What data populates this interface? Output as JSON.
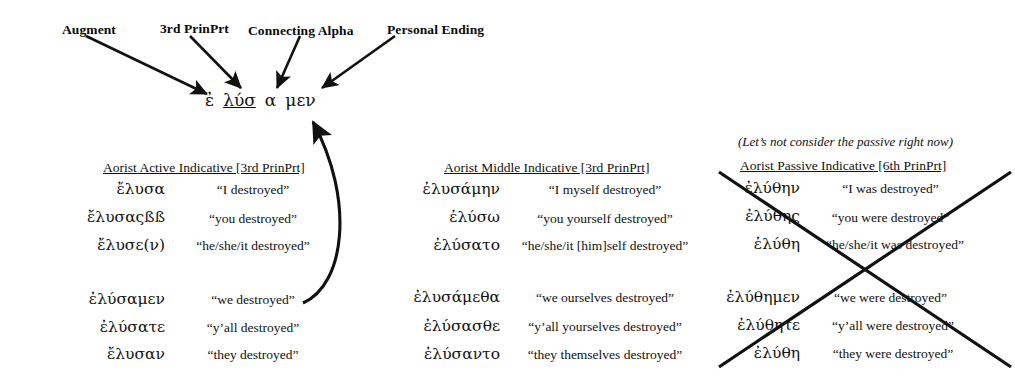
{
  "diagram": {
    "labels": [
      {
        "text": "Augment",
        "x": 62,
        "y": 22
      },
      {
        "text": "3rd PrinPrt",
        "x": 160,
        "y": 21
      },
      {
        "text": "Connecting Alpha",
        "x": 248,
        "y": 23
      },
      {
        "text": "Personal Ending",
        "x": 387,
        "y": 22
      }
    ],
    "parsed_word": {
      "x": 205,
      "y": 90,
      "segments": [
        {
          "text": "ἐ",
          "underline": false,
          "name": "augment"
        },
        {
          "text": "λύσ",
          "underline": true,
          "name": "third-principal-part"
        },
        {
          "text": "α",
          "underline": false,
          "name": "connecting-alpha"
        },
        {
          "text": "μεν",
          "underline": false,
          "name": "personal-ending"
        }
      ]
    }
  },
  "columns": [
    {
      "id": "active",
      "header": "Aorist Active Indicative [3rd PrinPrt]",
      "header_x": 103,
      "header_y": 160,
      "greek_right": 165,
      "gloss_center": 253,
      "rows": [
        {
          "greek": "ἔλυσα",
          "gloss": "“I destroyed”",
          "y": 180
        },
        {
          "greek": "ἔλυσαςßß",
          "gloss": "“you destroyed”",
          "y": 211
        },
        {
          "greek": "ἔλυσε(ν)",
          "gloss": "“he/she/it destroyed”",
          "y": 238
        },
        {
          "greek": "ἐλύσαμεν",
          "gloss": "“we destroyed”",
          "y": 292
        },
        {
          "greek": "ἐλύσατε",
          "gloss": "“y’all destroyed”",
          "y": 320
        },
        {
          "greek": "ἔλυσαν",
          "gloss": "“they destroyed”",
          "y": 347
        }
      ]
    },
    {
      "id": "middle",
      "header": "Aorist Middle Indicative [3rd PrinPrt]",
      "header_x": 444,
      "header_y": 160,
      "greek_right": 500,
      "gloss_center": 605,
      "rows": [
        {
          "greek": "ἐλυσάμην",
          "gloss": "“I myself destroyed”",
          "y": 182
        },
        {
          "greek": "ἐλύσω",
          "gloss": "“you yourself destroyed”",
          "y": 211
        },
        {
          "greek": "ἐλύσατο",
          "gloss": "“he/she/it [him]self destroyed”",
          "y": 238
        },
        {
          "greek": "ἐλυσάμεθα",
          "gloss": "“we ourselves destroyed”",
          "y": 290
        },
        {
          "greek": "ἐλύσασθε",
          "gloss": "“y’all yourselves destroyed”",
          "y": 319
        },
        {
          "greek": "ἐλύσαντο",
          "gloss": "“they themselves destroyed”",
          "y": 347
        }
      ]
    },
    {
      "id": "passive",
      "header": "Aorist Passive Indicative [6th PrinPrt]",
      "header_x": 740,
      "header_y": 158,
      "greek_right": 800,
      "gloss_center": 890,
      "rows": [
        {
          "greek": "ἐλύθην",
          "gloss": "“I was destroyed”",
          "y": 181
        },
        {
          "greek": "ἐλύθης",
          "gloss": "“you were destroyed”",
          "y": 210
        },
        {
          "greek": "ἐλύθη",
          "gloss": "“he/she/it was destroyed”",
          "y": 237
        },
        {
          "greek": "ἐλύθημεν",
          "gloss": "“we were destroyed”",
          "y": 290
        },
        {
          "greek": "ἐλύθητε",
          "gloss": "“y’all were destroyed”",
          "y": 318
        },
        {
          "greek": "ἐλύθη",
          "gloss": "“they were destroyed”",
          "y": 346
        }
      ]
    }
  ],
  "passive_note": {
    "text": "(Let’s not consider the passive right now)",
    "x": 738,
    "y": 134
  },
  "colors": {
    "ink": "#111111",
    "background": "#ffffff"
  }
}
